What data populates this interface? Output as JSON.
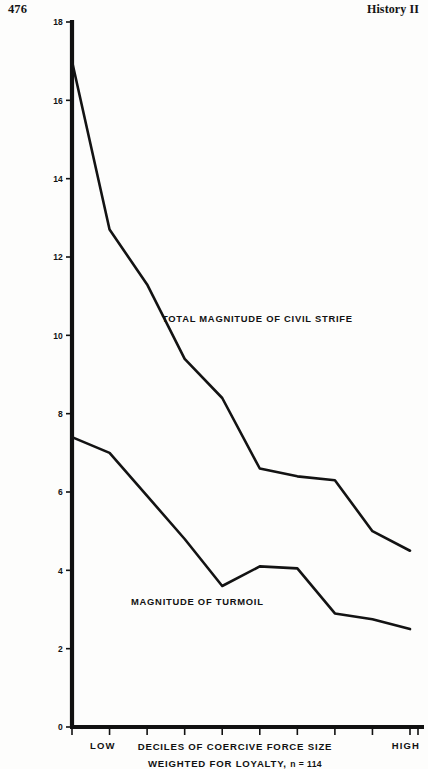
{
  "page": {
    "folio": "476",
    "running_title": "History II"
  },
  "chart_data": {
    "type": "line",
    "title": "",
    "xlabel": "DECILES OF COERCIVE FORCE SIZE",
    "xlabel_line2_prefix": "WEIGHTED FOR LOYALTY,",
    "xlabel_line2_n": "n = 114",
    "ylabel": "",
    "ylim": [
      0,
      18
    ],
    "ytick_labels": [
      "0",
      "2",
      "4",
      "6",
      "8",
      "10",
      "12",
      "14",
      "16",
      "18"
    ],
    "ytick_values": [
      0,
      2,
      4,
      6,
      8,
      10,
      12,
      14,
      16,
      18
    ],
    "x": [
      1,
      2,
      3,
      4,
      5,
      6,
      7,
      8,
      9,
      10
    ],
    "categories": [
      "1",
      "2",
      "3",
      "4",
      "5",
      "6",
      "7",
      "8",
      "9",
      "10"
    ],
    "xtick_label_low": "LOW",
    "xtick_label_high": "HIGH",
    "grid": false,
    "legend_position": "inline-annotation",
    "series": [
      {
        "name": "TOTAL MAGNITUDE OF CIVIL STRIFE",
        "values": [
          17.0,
          12.7,
          11.3,
          9.4,
          8.4,
          6.6,
          6.4,
          6.3,
          5.0,
          4.5
        ],
        "color": "#131313"
      },
      {
        "name": "MAGNITUDE OF TURMOIL",
        "values": [
          7.4,
          7.0,
          5.9,
          4.8,
          3.6,
          4.1,
          4.05,
          2.9,
          2.75,
          2.5
        ],
        "color": "#131313"
      }
    ],
    "annotations": [
      {
        "text": "TOTAL MAGNITUDE OF CIVIL STRIFE",
        "x_px": 162,
        "y_px": 322
      },
      {
        "text": "MAGNITUDE OF TURMOIL",
        "x_px": 131,
        "y_px": 605
      }
    ]
  }
}
